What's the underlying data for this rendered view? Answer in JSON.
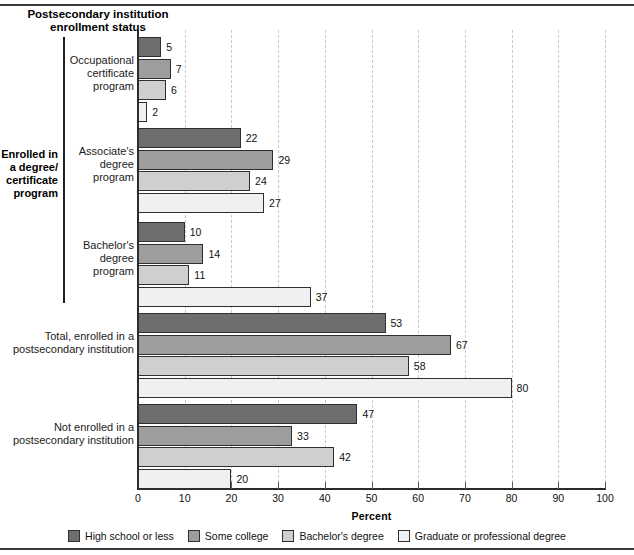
{
  "header": {
    "column_header": "Postsecondary institution\nenrollment status"
  },
  "bracket": {
    "label": "Enrolled in\na degree/\ncertificate\nprogram"
  },
  "axis": {
    "ticks": [
      0,
      10,
      20,
      30,
      40,
      50,
      60,
      70,
      80,
      90,
      100
    ],
    "title": "Percent"
  },
  "legend": {
    "items": [
      {
        "label": "High school or less",
        "color": "#6e6e6e"
      },
      {
        "label": "Some college",
        "color": "#9d9d9d"
      },
      {
        "label": "Bachelor's degree",
        "color": "#cfcfcf"
      },
      {
        "label": "Graduate or professional degree",
        "color": "#f0f0f0"
      }
    ]
  },
  "chart_data": {
    "type": "bar",
    "orientation": "horizontal",
    "title": "Postsecondary institution enrollment status",
    "xlabel": "Percent",
    "ylabel": "",
    "xlim": [
      0,
      100
    ],
    "xticks": [
      0,
      10,
      20,
      30,
      40,
      50,
      60,
      70,
      80,
      90,
      100
    ],
    "grid": "vertical-dashed",
    "legend_position": "bottom",
    "categories": [
      "Occupational certificate program",
      "Associate's degree program",
      "Bachelor's degree program",
      "Total, enrolled in a postsecondary institution",
      "Not enrolled in a postsecondary institution"
    ],
    "series": [
      {
        "name": "High school or less",
        "color": "#6e6e6e",
        "values": [
          5,
          22,
          10,
          53,
          47
        ]
      },
      {
        "name": "Some college",
        "color": "#9d9d9d",
        "values": [
          7,
          29,
          14,
          67,
          33
        ]
      },
      {
        "name": "Bachelor's degree",
        "color": "#cfcfcf",
        "values": [
          6,
          24,
          11,
          58,
          42
        ]
      },
      {
        "name": "Graduate or professional degree",
        "color": "#f0f0f0",
        "values": [
          2,
          27,
          37,
          80,
          20
        ]
      }
    ]
  },
  "groups": [
    {
      "label": "Occupational\ncertificate\nprogram",
      "values": [
        5,
        7,
        6,
        2
      ]
    },
    {
      "label": "Associate's\ndegree\nprogram",
      "values": [
        22,
        29,
        24,
        27
      ]
    },
    {
      "label": "Bachelor's\ndegree\nprogram",
      "values": [
        10,
        14,
        11,
        37
      ]
    },
    {
      "label": "Total, enrolled in a\npostsecondary institution",
      "values": [
        53,
        67,
        58,
        80
      ]
    },
    {
      "label": "Not enrolled in a\npostsecondary institution",
      "values": [
        47,
        33,
        42,
        20
      ]
    }
  ]
}
